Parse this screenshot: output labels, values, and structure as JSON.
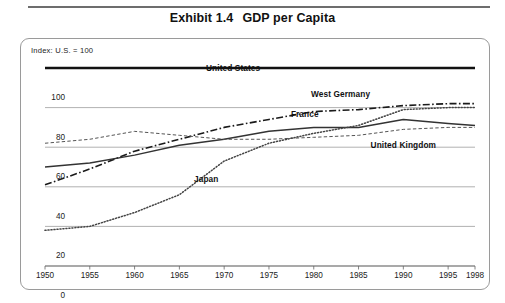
{
  "title": {
    "exhibit": "Exhibit 1.4",
    "name": "GDP per Capita"
  },
  "note": "Index: U.S. = 100",
  "chart_data": {
    "type": "line",
    "subtitle": "Index: U.S. = 100",
    "xlabel": "",
    "ylabel": "",
    "xlim": [
      1950,
      1998
    ],
    "ylim": [
      0,
      100
    ],
    "yticks": [
      0,
      20,
      40,
      60,
      80,
      100
    ],
    "xticks": [
      1950,
      1955,
      1960,
      1965,
      1970,
      1975,
      1980,
      1985,
      1990,
      1995,
      1998
    ],
    "grid": true,
    "legend": "inline-annotations",
    "x": [
      1950,
      1955,
      1960,
      1965,
      1970,
      1975,
      1980,
      1985,
      1990,
      1995,
      1998
    ],
    "series": [
      {
        "name": "United States",
        "style": "solid-thick",
        "color": "#111111",
        "values": [
          100,
          100,
          100,
          100,
          100,
          100,
          100,
          100,
          100,
          100,
          100
        ],
        "label_x": 1971,
        "label_y": 100
      },
      {
        "name": "West Germany",
        "style": "dash-dot",
        "color": "#1a1a1a",
        "values": [
          41,
          49,
          58,
          64,
          70,
          74,
          78,
          79,
          81,
          82,
          82
        ],
        "label_x": 1983,
        "label_y": 87
      },
      {
        "name": "France",
        "style": "solid",
        "color": "#333333",
        "values": [
          50,
          52,
          56,
          61,
          64,
          68,
          70,
          70,
          74,
          72,
          71
        ],
        "label_x": 1979,
        "label_y": 77
      },
      {
        "name": "United Kingdom",
        "style": "dashed-fine",
        "color": "#555555",
        "values": [
          62,
          64,
          68,
          66,
          64,
          64,
          65,
          66,
          69,
          70,
          70
        ],
        "label_x": 1990,
        "label_y": 61
      },
      {
        "name": "Japan",
        "style": "dotted",
        "color": "#444444",
        "values": [
          18,
          20,
          27,
          36,
          53,
          62,
          67,
          71,
          79,
          80,
          80
        ],
        "label_x": 1968,
        "label_y": 44
      }
    ]
  }
}
